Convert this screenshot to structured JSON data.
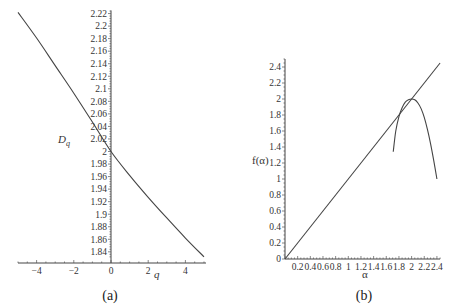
{
  "chart_data": [
    {
      "id": "a",
      "type": "line",
      "caption": "(a)",
      "title": "",
      "xlabel": "q",
      "ylabel": "D_q",
      "ylabel_main": "D",
      "ylabel_sub": "q",
      "xlim": [
        -5,
        5
      ],
      "ylim": [
        1.83,
        2.225
      ],
      "grid": false,
      "x_ticks": [
        -4,
        -2,
        0,
        2,
        4
      ],
      "x_tick_labels": [
        "−4",
        "−2",
        "0",
        "2",
        "4"
      ],
      "y_ticks": [
        1.84,
        1.86,
        1.88,
        1.9,
        1.92,
        1.94,
        1.96,
        1.98,
        2.0,
        2.02,
        2.04,
        2.06,
        2.08,
        2.1,
        2.12,
        2.14,
        2.16,
        2.18,
        2.2,
        2.22
      ],
      "y_tick_labels": [
        "1.84",
        "1.86",
        "1.88",
        "1.9",
        "1.92",
        "1.94",
        "1.96",
        "1.98",
        "2",
        "2.02",
        "2.04",
        "2.06",
        "2.08",
        "2.1",
        "2.12",
        "2.14",
        "2.16",
        "2.18",
        "2.2",
        "2.22"
      ],
      "series": [
        {
          "name": "D_q",
          "x": [
            -5,
            -4,
            -3,
            -2,
            -1,
            0,
            1,
            2,
            3,
            4,
            5
          ],
          "y": [
            2.222,
            2.181,
            2.137,
            2.093,
            2.047,
            2.0,
            1.962,
            1.927,
            1.894,
            1.862,
            1.832
          ]
        }
      ]
    },
    {
      "id": "b",
      "type": "line",
      "caption": "(b)",
      "title": "",
      "xlabel": "α",
      "ylabel": "f(α)",
      "xlim": [
        0,
        2.45
      ],
      "ylim": [
        0,
        2.5
      ],
      "grid": false,
      "x_ticks": [
        0.2,
        0.4,
        0.6,
        0.8,
        1,
        1.2,
        1.4,
        1.6,
        1.8,
        2,
        2.2,
        2.4
      ],
      "x_tick_labels": [
        "0.2",
        "0.4",
        "0.6",
        "0.8",
        "1",
        "1.2",
        "1.4",
        "1.6",
        "1.8",
        "2",
        "2.2",
        "2.4"
      ],
      "y_ticks": [
        0,
        0.2,
        0.4,
        0.6,
        0.8,
        1,
        1.2,
        1.4,
        1.6,
        1.8,
        2,
        2.2,
        2.4
      ],
      "y_tick_labels": [
        "0",
        "0.2",
        "0.4",
        "0.6",
        "0.8",
        "1",
        "1.2",
        "1.4",
        "1.6",
        "1.8",
        "2",
        "2.2",
        "2.4"
      ],
      "series": [
        {
          "name": "f(α) = α",
          "x": [
            0,
            2.45
          ],
          "y": [
            0,
            2.45
          ]
        },
        {
          "name": "f(α) spectrum",
          "x": [
            1.71,
            1.75,
            1.8,
            1.85,
            1.9,
            1.95,
            2.0,
            2.05,
            2.1,
            2.15,
            2.2,
            2.25,
            2.3,
            2.35,
            2.4
          ],
          "y": [
            1.34,
            1.6,
            1.78,
            1.89,
            1.96,
            1.99,
            2.0,
            1.99,
            1.95,
            1.88,
            1.77,
            1.62,
            1.44,
            1.23,
            1.0
          ]
        }
      ]
    }
  ]
}
